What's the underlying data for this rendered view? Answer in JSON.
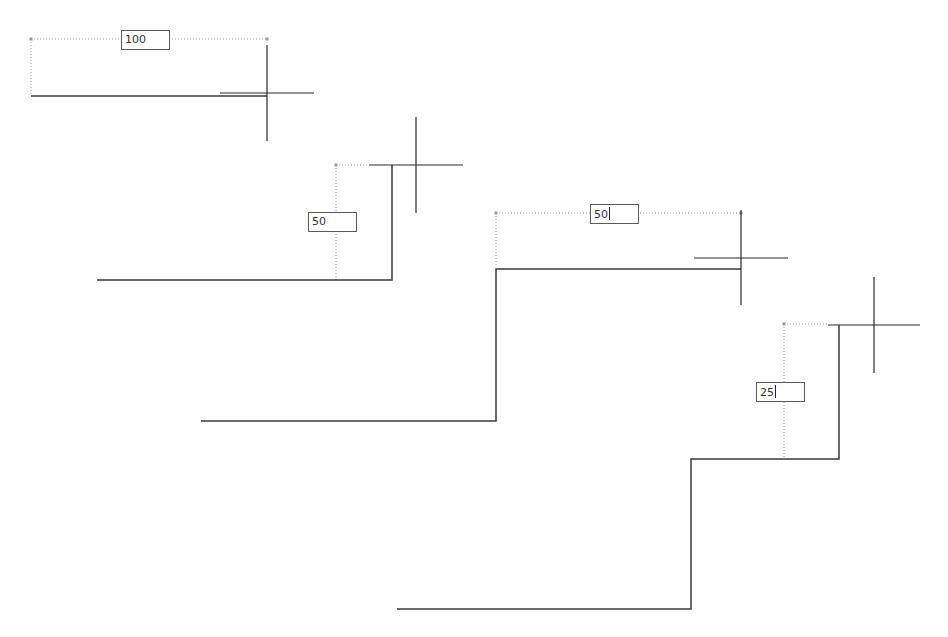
{
  "colors": {
    "background": "#ffffff",
    "line": "#3a3a3a",
    "crosshair": "#2a2a2a",
    "dimension_guide": "#a0a0a0",
    "input_border": "#5a5a5a"
  },
  "steps": [
    {
      "id": "step-1",
      "input_value": "100",
      "input_caret": false,
      "input_box": {
        "x": 121,
        "y": 30
      },
      "polyline": [
        [
          31,
          96
        ],
        [
          267,
          96
        ]
      ],
      "guides": [
        [
          [
            31,
            39
          ],
          [
            267,
            39
          ]
        ],
        [
          [
            31,
            39
          ],
          [
            31,
            96
          ]
        ]
      ],
      "guide_points": [
        [
          31,
          39
        ],
        [
          267,
          39
        ]
      ],
      "crosshair": {
        "x": 267,
        "y": 93,
        "h_from": 220,
        "h_to": 314,
        "v_from": 45,
        "v_to": 141
      }
    },
    {
      "id": "step-2",
      "input_value": "50",
      "input_caret": false,
      "input_box": {
        "x": 308,
        "y": 212
      },
      "polyline": [
        [
          97,
          280
        ],
        [
          392,
          280
        ],
        [
          392,
          165
        ]
      ],
      "guides": [
        [
          [
            336,
            165
          ],
          [
            336,
            280
          ]
        ],
        [
          [
            336,
            165
          ],
          [
            369,
            165
          ]
        ]
      ],
      "guide_points": [
        [
          336,
          165
        ]
      ],
      "crosshair": {
        "x": 416,
        "y": 165,
        "h_from": 369,
        "h_to": 463,
        "v_from": 117,
        "v_to": 213
      }
    },
    {
      "id": "step-3",
      "input_value": "50",
      "input_caret": true,
      "input_box": {
        "x": 590,
        "y": 204
      },
      "polyline": [
        [
          201,
          421
        ],
        [
          496,
          421
        ],
        [
          496,
          269
        ],
        [
          741,
          269
        ]
      ],
      "guides": [
        [
          [
            496,
            213
          ],
          [
            741,
            213
          ]
        ],
        [
          [
            496,
            213
          ],
          [
            496,
            265
          ]
        ]
      ],
      "guide_points": [
        [
          496,
          213
        ],
        [
          741,
          213
        ]
      ],
      "crosshair": {
        "x": 741,
        "y": 258,
        "h_from": 694,
        "h_to": 788,
        "v_from": 210,
        "v_to": 305
      }
    },
    {
      "id": "step-4",
      "input_value": "25",
      "input_caret": true,
      "input_box": {
        "x": 756,
        "y": 382
      },
      "polyline": [
        [
          397,
          609
        ],
        [
          691,
          609
        ],
        [
          691,
          459
        ],
        [
          839,
          459
        ],
        [
          839,
          325
        ]
      ],
      "guides": [
        [
          [
            784,
            324
          ],
          [
            784,
            459
          ]
        ],
        [
          [
            784,
            324
          ],
          [
            828,
            324
          ]
        ]
      ],
      "guide_points": [
        [
          784,
          324
        ]
      ],
      "crosshair": {
        "x": 874,
        "y": 325,
        "h_from": 828,
        "h_to": 920,
        "v_from": 277,
        "v_to": 373
      }
    }
  ]
}
